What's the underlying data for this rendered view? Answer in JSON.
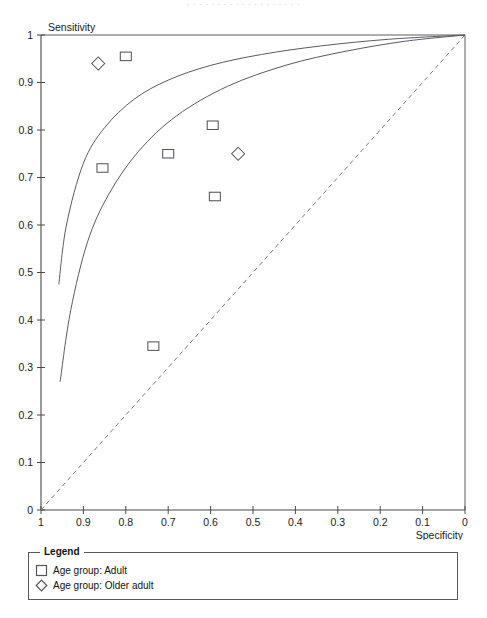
{
  "page": {
    "cut_off_header": "· · · · · · · · · · · · · · · · · · ·"
  },
  "axes": {
    "y_title": "Sensitivity",
    "x_title": "Specificity",
    "y_ticks": [
      "1",
      "0.9",
      "0.8",
      "0.7",
      "0.6",
      "0.5",
      "0.4",
      "0.3",
      "0.2",
      "0.1",
      "0"
    ],
    "x_ticks": [
      "1",
      "0.9",
      "0.8",
      "0.7",
      "0.6",
      "0.5",
      "0.4",
      "0.3",
      "0.2",
      "0.1",
      "0"
    ]
  },
  "legend": {
    "title": "Legend",
    "items": [
      {
        "symbol": "square-marker",
        "label": "Age group: Adult"
      },
      {
        "symbol": "diamond-marker",
        "label": "Age group: Older adult"
      }
    ]
  },
  "colors": {
    "axis": "#4a4a4a",
    "curve": "#5a5a66",
    "marker": "#55555f",
    "diagonal": "#6a6a74",
    "text": "#1a1a1a"
  },
  "chart_data": {
    "type": "scatter",
    "title": "",
    "subtitle": "",
    "xlabel": "Specificity",
    "ylabel": "Sensitivity",
    "xlim": [
      1,
      0
    ],
    "ylim": [
      0,
      1
    ],
    "x_axis_reversed": true,
    "grid": false,
    "legend_position": "bottom",
    "series": [
      {
        "name": "Age group: Adult",
        "marker": "square",
        "points": [
          {
            "specificity": 0.8,
            "sensitivity": 0.955
          },
          {
            "specificity": 0.855,
            "sensitivity": 0.72
          },
          {
            "specificity": 0.7,
            "sensitivity": 0.75
          },
          {
            "specificity": 0.595,
            "sensitivity": 0.81
          },
          {
            "specificity": 0.59,
            "sensitivity": 0.66
          },
          {
            "specificity": 0.735,
            "sensitivity": 0.345
          }
        ]
      },
      {
        "name": "Age group: Older adult",
        "marker": "diamond",
        "points": [
          {
            "specificity": 0.865,
            "sensitivity": 0.94
          },
          {
            "specificity": 0.535,
            "sensitivity": 0.75
          }
        ]
      }
    ],
    "curves": [
      {
        "name": "SROC curve upper",
        "style": "solid",
        "points": [
          {
            "specificity": 0.958,
            "sensitivity": 0.475
          },
          {
            "specificity": 0.94,
            "sensitivity": 0.6
          },
          {
            "specificity": 0.9,
            "sensitivity": 0.73
          },
          {
            "specificity": 0.85,
            "sensitivity": 0.805
          },
          {
            "specificity": 0.78,
            "sensitivity": 0.865
          },
          {
            "specificity": 0.7,
            "sensitivity": 0.905
          },
          {
            "specificity": 0.6,
            "sensitivity": 0.936
          },
          {
            "specificity": 0.48,
            "sensitivity": 0.959
          },
          {
            "specificity": 0.34,
            "sensitivity": 0.977
          },
          {
            "specificity": 0.18,
            "sensitivity": 0.991
          },
          {
            "specificity": 0.0,
            "sensitivity": 1.0
          }
        ]
      },
      {
        "name": "SROC curve lower",
        "style": "solid",
        "points": [
          {
            "specificity": 0.955,
            "sensitivity": 0.27
          },
          {
            "specificity": 0.93,
            "sensitivity": 0.42
          },
          {
            "specificity": 0.89,
            "sensitivity": 0.565
          },
          {
            "specificity": 0.84,
            "sensitivity": 0.665
          },
          {
            "specificity": 0.77,
            "sensitivity": 0.755
          },
          {
            "specificity": 0.68,
            "sensitivity": 0.83
          },
          {
            "specificity": 0.56,
            "sensitivity": 0.892
          },
          {
            "specificity": 0.42,
            "sensitivity": 0.937
          },
          {
            "specificity": 0.28,
            "sensitivity": 0.966
          },
          {
            "specificity": 0.14,
            "sensitivity": 0.987
          },
          {
            "specificity": 0.0,
            "sensitivity": 1.0
          }
        ]
      },
      {
        "name": "reference diagonal",
        "style": "dashed",
        "points": [
          {
            "specificity": 1.0,
            "sensitivity": 0.0
          },
          {
            "specificity": 0.0,
            "sensitivity": 1.0
          }
        ]
      }
    ]
  }
}
